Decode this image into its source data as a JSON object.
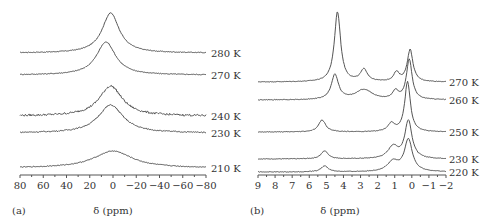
{
  "chart_data": [
    {
      "type": "line",
      "panel_label": "(a)",
      "title": "",
      "xlabel": "δ (ppm)",
      "ylabel": "",
      "xlim": [
        80,
        -80
      ],
      "x_ticks": [
        "80",
        "60",
        "40",
        "20",
        "0",
        "−20",
        "−40",
        "−60",
        "−80"
      ],
      "grid": false,
      "layout": {
        "axis_px": [
          20,
          206
        ],
        "axis_y": 175,
        "label_x": 211
      },
      "series": [
        {
          "name": "280 K",
          "baseline_y": 53,
          "peaks": [
            {
              "ppm": 2,
              "height": 40,
              "width": 9
            }
          ],
          "wing": 0.55,
          "noise": 0.4
        },
        {
          "name": "270 K",
          "baseline_y": 75,
          "peaks": [
            {
              "ppm": 6,
              "height": 33,
              "width": 10
            }
          ],
          "wing": 0.5,
          "noise": 0.4
        },
        {
          "name": "240 K",
          "baseline_y": 116,
          "peaks": [
            {
              "ppm": 2,
              "height": 30,
              "width": 12
            }
          ],
          "wing": 0.45,
          "noise": 1.0
        },
        {
          "name": "230 K",
          "baseline_y": 133,
          "peaks": [
            {
              "ppm": 2,
              "height": 28,
              "width": 13
            }
          ],
          "wing": 0.45,
          "noise": 0.6
        },
        {
          "name": "210 K",
          "baseline_y": 168,
          "peaks": [
            {
              "ppm": 0,
              "height": 17,
              "width": 20
            }
          ],
          "wing": 0.4,
          "noise": 0.4
        }
      ]
    },
    {
      "type": "line",
      "panel_label": "(b)",
      "title": "",
      "xlabel": "δ (ppm)",
      "ylabel": "",
      "xlim": [
        9,
        -2
      ],
      "x_ticks": [
        "9",
        "8",
        "7",
        "6",
        "5",
        "4",
        "3",
        "2",
        "1",
        "0",
        "−1",
        "−2"
      ],
      "grid": false,
      "layout": {
        "axis_px": [
          258,
          446
        ],
        "axis_y": 175,
        "label_x": 449
      },
      "series": [
        {
          "name": "270 K",
          "baseline_y": 82,
          "peaks": [
            {
              "ppm": 4.35,
              "height": 70,
              "width": 0.22
            },
            {
              "ppm": 2.8,
              "height": 12,
              "width": 0.25
            },
            {
              "ppm": 0.9,
              "height": 9,
              "width": 0.2
            },
            {
              "ppm": 0.1,
              "height": 32,
              "width": 0.2
            }
          ],
          "noise": 0.3
        },
        {
          "name": "260 K",
          "baseline_y": 100,
          "peaks": [
            {
              "ppm": 4.5,
              "height": 25,
              "width": 0.25
            },
            {
              "ppm": 2.8,
              "height": 10,
              "width": 0.6
            },
            {
              "ppm": 0.95,
              "height": 8,
              "width": 0.2
            },
            {
              "ppm": 0.15,
              "height": 40,
              "width": 0.2
            }
          ],
          "noise": 0.3
        },
        {
          "name": "250 K",
          "baseline_y": 132,
          "peaks": [
            {
              "ppm": 5.25,
              "height": 12,
              "width": 0.25
            },
            {
              "ppm": 1.2,
              "height": 8,
              "width": 0.25
            },
            {
              "ppm": 0.25,
              "height": 50,
              "width": 0.2
            }
          ],
          "noise": 0.3
        },
        {
          "name": "230 K",
          "baseline_y": 159,
          "peaks": [
            {
              "ppm": 5.1,
              "height": 8,
              "width": 0.25
            },
            {
              "ppm": 1.1,
              "height": 12,
              "width": 0.35
            },
            {
              "ppm": 0.2,
              "height": 38,
              "width": 0.25
            }
          ],
          "noise": 0.3
        },
        {
          "name": "220 K",
          "baseline_y": 172,
          "peaks": [
            {
              "ppm": 5.1,
              "height": 6,
              "width": 0.25
            },
            {
              "ppm": 1.1,
              "height": 10,
              "width": 0.4
            },
            {
              "ppm": 0.2,
              "height": 32,
              "width": 0.28
            }
          ],
          "noise": 0.3
        }
      ]
    }
  ]
}
